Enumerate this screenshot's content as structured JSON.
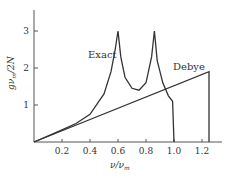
{
  "chart_data": {
    "type": "line",
    "title": "",
    "xlabel": "ν/ν_m",
    "ylabel": "g ν_m/2N",
    "xlim": [
      0,
      1.35
    ],
    "ylim": [
      0,
      3.5
    ],
    "xticks": [
      "0.2",
      "0.4",
      "0.6",
      "0.8",
      "1.0",
      "1.2"
    ],
    "yticks": [
      "1",
      "2",
      "3"
    ],
    "grid": false,
    "legend": "inline labels",
    "series": [
      {
        "name": "Exact",
        "x": [
          0,
          0.2,
          0.3,
          0.4,
          0.5,
          0.55,
          0.58,
          0.6,
          0.6,
          0.62,
          0.65,
          0.7,
          0.75,
          0.8,
          0.84,
          0.86,
          0.86,
          0.88,
          0.92,
          0.96,
          0.99,
          0.99,
          1.0
        ],
        "y": [
          0,
          0.33,
          0.5,
          0.75,
          1.3,
          1.9,
          2.5,
          3.0,
          3.0,
          2.3,
          1.75,
          1.45,
          1.4,
          1.6,
          2.3,
          3.0,
          3.0,
          2.2,
          1.6,
          1.25,
          1.1,
          1.1,
          0
        ]
      },
      {
        "name": "Debye",
        "x": [
          0,
          1.25,
          1.25
        ],
        "y": [
          0,
          1.9,
          0
        ]
      }
    ],
    "annotations": [
      {
        "text": "Exact",
        "x": 0.5,
        "y": 2.2
      },
      {
        "text": "Debye",
        "x": 1.1,
        "y": 2.1
      }
    ]
  },
  "labels": {
    "exact": "Exact",
    "debye": "Debye",
    "xlabel": "ν/ν",
    "xlabel_sub": "m",
    "ylabel_pre": "gν",
    "ylabel_sub": "m",
    "ylabel_post": "/2N"
  }
}
